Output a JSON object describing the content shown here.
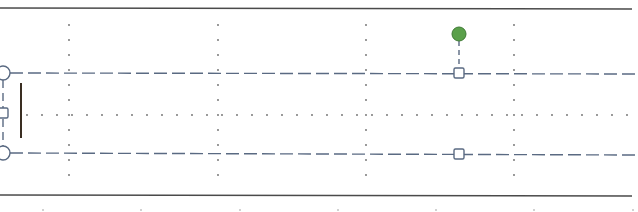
{
  "editor": {
    "view": "document-canvas-with-selected-text-box",
    "page_border_color": "#4a4a4a",
    "gridline_color": "#6b6b6b",
    "selection_outline_color": "#5a6a82",
    "handle_stroke_color": "#5a6a82",
    "handle_fill_color": "#ffffff",
    "rotation_handle_color": "#5aa04a",
    "rotation_handle_stroke": "#3e7a34",
    "text_cursor_color": "#3a2e22"
  },
  "page_borders": {
    "top_y": 8,
    "bottom_y": 195,
    "x_start": 0,
    "x_end": 632
  },
  "gridlines": {
    "vertical_x": [
      69,
      218,
      366,
      514
    ],
    "horizontal_dotted_y": 115,
    "dot_spacing": 15,
    "y_range": [
      25,
      180
    ]
  },
  "ruler_ticks_bottom": {
    "y": 210,
    "x": [
      43,
      141,
      240,
      338,
      436,
      534,
      633
    ]
  },
  "text_box_selection": {
    "top_y": 73,
    "bottom_y": 154,
    "left_x": 3,
    "right_x": 638,
    "handles": [
      {
        "name": "top-left-corner-handle",
        "shape": "circle",
        "x": 3,
        "y": 73
      },
      {
        "name": "middle-left-handle",
        "shape": "square",
        "x": 3,
        "y": 113
      },
      {
        "name": "bottom-left-corner-handle",
        "shape": "circle",
        "x": 3,
        "y": 153
      },
      {
        "name": "top-middle-handle",
        "shape": "square",
        "x": 459,
        "y": 73
      },
      {
        "name": "bottom-middle-handle",
        "shape": "square",
        "x": 459,
        "y": 154
      }
    ],
    "rotation_handle": {
      "x": 459,
      "y": 34,
      "r": 7
    }
  },
  "text_cursor": {
    "x": 21,
    "y_top": 83,
    "y_bottom": 138
  }
}
